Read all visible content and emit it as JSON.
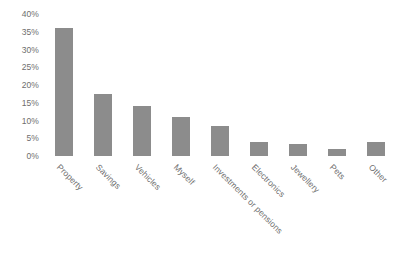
{
  "chart_data": {
    "type": "bar",
    "title": "",
    "subtitle": "",
    "xlabel": "",
    "ylabel": "",
    "ylim": [
      0,
      40
    ],
    "grid": false,
    "legend": false,
    "y_tick_labels": [
      "40%",
      "35%",
      "30%",
      "25%",
      "20%",
      "15%",
      "10%",
      "5%",
      "0%"
    ],
    "y_tick_values": [
      40,
      35,
      30,
      25,
      20,
      15,
      10,
      5,
      0
    ],
    "bar_color": "#8c8c8c",
    "axis_text_color": "#6e6e6e",
    "background_color": "#ffffff",
    "categories": [
      "Property",
      "Savings",
      "Vehicles",
      "Myself",
      "Investments or pensions",
      "Electronics",
      "Jewellery",
      "Pets",
      "Other"
    ],
    "values": [
      36,
      17.5,
      14,
      11,
      8.5,
      4,
      3.5,
      2,
      4
    ]
  }
}
